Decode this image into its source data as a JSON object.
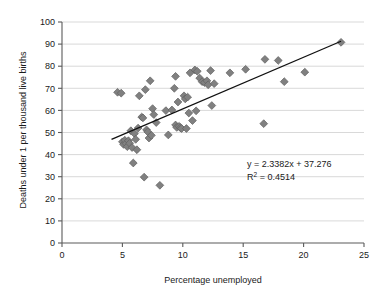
{
  "chart_data": {
    "type": "scatter",
    "title": "",
    "xlabel": "Percentage unemployed",
    "ylabel": "Deaths under 1 per thousand live births",
    "xlim": [
      0,
      25
    ],
    "ylim": [
      0,
      100
    ],
    "xticks": [
      "0",
      "5",
      "10",
      "15",
      "20",
      "25"
    ],
    "yticks": [
      "0",
      "10",
      "20",
      "30",
      "40",
      "50",
      "60",
      "70",
      "80",
      "90",
      "100"
    ],
    "grid": "horizontal",
    "legend": "none",
    "marker_shape": "diamond",
    "marker_color": "#808080",
    "marker_edge_color": "#5e5e5e",
    "trendline_color": "#111111",
    "gridline_color": "#c9c9c9",
    "axis_color": "#5a5a5a",
    "annotations": {
      "equation": "y = 2.3382x + 37.276",
      "r_squared_prefix": "R",
      "r_squared_sup": "2",
      "r_squared_value": " = 0.4514"
    },
    "trendline": {
      "slope": 2.3382,
      "intercept": 37.276,
      "r_squared": 0.4514,
      "x_start": 4.1,
      "x_end": 23.1
    },
    "points": [
      [
        4.6,
        68.2
      ],
      [
        4.9,
        67.8
      ],
      [
        5.0,
        45.8
      ],
      [
        5.1,
        44.6
      ],
      [
        5.2,
        46.5
      ],
      [
        5.3,
        45.0
      ],
      [
        5.4,
        43.6
      ],
      [
        5.5,
        46.3
      ],
      [
        5.6,
        45.1
      ],
      [
        5.7,
        50.8
      ],
      [
        5.8,
        43.2
      ],
      [
        5.9,
        36.2
      ],
      [
        6.0,
        49.5
      ],
      [
        6.1,
        46.9
      ],
      [
        6.2,
        42.2
      ],
      [
        6.3,
        52.0
      ],
      [
        6.4,
        66.6
      ],
      [
        6.6,
        57.0
      ],
      [
        6.7,
        56.6
      ],
      [
        6.8,
        29.8
      ],
      [
        6.9,
        69.4
      ],
      [
        7.0,
        51.2
      ],
      [
        7.1,
        50.3
      ],
      [
        7.2,
        47.5
      ],
      [
        7.3,
        73.4
      ],
      [
        7.4,
        48.7
      ],
      [
        7.5,
        60.8
      ],
      [
        7.6,
        58.1
      ],
      [
        7.8,
        54.5
      ],
      [
        8.1,
        26.1
      ],
      [
        8.6,
        59.9
      ],
      [
        8.8,
        48.9
      ],
      [
        9.1,
        60.2
      ],
      [
        9.3,
        70.0
      ],
      [
        9.4,
        75.4
      ],
      [
        9.4,
        53.4
      ],
      [
        9.5,
        52.3
      ],
      [
        9.6,
        63.8
      ],
      [
        9.7,
        52.8
      ],
      [
        9.8,
        52.1
      ],
      [
        9.9,
        51.8
      ],
      [
        10.1,
        66.6
      ],
      [
        10.2,
        65.2
      ],
      [
        10.3,
        51.8
      ],
      [
        10.4,
        66.0
      ],
      [
        10.5,
        58.8
      ],
      [
        10.6,
        77.0
      ],
      [
        10.8,
        55.4
      ],
      [
        11.0,
        78.3
      ],
      [
        11.1,
        59.8
      ],
      [
        11.2,
        77.7
      ],
      [
        11.4,
        74.6
      ],
      [
        11.6,
        73.0
      ],
      [
        11.8,
        72.6
      ],
      [
        12.0,
        73.4
      ],
      [
        12.1,
        71.6
      ],
      [
        12.3,
        78.0
      ],
      [
        12.4,
        62.2
      ],
      [
        12.6,
        72.1
      ],
      [
        13.9,
        77.0
      ],
      [
        15.2,
        78.6
      ],
      [
        16.7,
        54.0
      ],
      [
        16.8,
        83.1
      ],
      [
        17.9,
        82.6
      ],
      [
        18.4,
        73.0
      ],
      [
        20.1,
        77.3
      ],
      [
        23.1,
        90.8
      ]
    ]
  }
}
